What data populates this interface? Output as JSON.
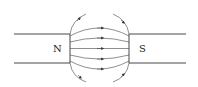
{
  "diagram": {
    "left_pole": {
      "label": "N"
    },
    "right_pole": {
      "label": "S"
    },
    "field_lines": 5,
    "outer_arcs": 4,
    "line_color": "#333333"
  }
}
